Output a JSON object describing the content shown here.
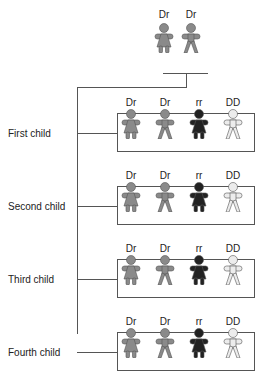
{
  "parents": {
    "genotypes": [
      "Dr",
      "Dr"
    ],
    "figures": [
      "female",
      "male"
    ],
    "color": "#8a8a8a"
  },
  "children": [
    {
      "label": "First child",
      "genotypes": [
        "Dr",
        "Dr",
        "rr",
        "DD"
      ]
    },
    {
      "label": "Second child",
      "genotypes": [
        "Dr",
        "Dr",
        "rr",
        "DD"
      ]
    },
    {
      "label": "Third child",
      "genotypes": [
        "Dr",
        "Dr",
        "rr",
        "DD"
      ]
    },
    {
      "label": "Fourth child",
      "genotypes": [
        "Dr",
        "Dr",
        "rr",
        "DD"
      ]
    }
  ],
  "child_figures": [
    "female",
    "male",
    "female",
    "male"
  ],
  "colors": {
    "Dr": "#8a8a8a",
    "rr": "#222222",
    "DD": "#ececec"
  }
}
